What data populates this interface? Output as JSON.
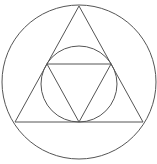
{
  "diagram": {
    "width": 157,
    "height": 164,
    "stroke_color": "#555555",
    "stroke_width": 1,
    "background": "#ffffff",
    "outer_circle": {
      "cx": 79,
      "cy": 82,
      "r": 77
    },
    "outer_triangle": {
      "points": [
        [
          79,
          6
        ],
        [
          15,
          122
        ],
        [
          143,
          122
        ]
      ]
    },
    "inner_circle": {
      "cx": 79,
      "cy": 84,
      "r": 38
    },
    "inner_triangle": {
      "points": [
        [
          47,
          64
        ],
        [
          111,
          64
        ],
        [
          79,
          122
        ]
      ]
    }
  }
}
